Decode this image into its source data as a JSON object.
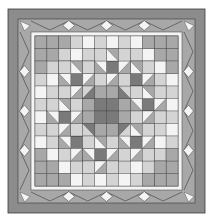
{
  "image": {
    "subject": "Quilt pattern",
    "width": 212,
    "height": 219
  },
  "colors": {
    "background": "#ffffff",
    "outer_border": "#8c8c8c",
    "dark": "#7a7a7a",
    "medium": "#a8a8a8",
    "light": "#d4d4d4",
    "white": "#f4f4f4",
    "line": "#3a3a3a"
  },
  "layout": {
    "quilt_box": [
      8,
      9,
      197,
      204
    ],
    "outer_band": 10,
    "sawtooth_band": 13,
    "white_strip": 4,
    "inner_box": [
      35,
      37,
      143,
      148
    ],
    "diamonds_per_side": 3
  },
  "blocks": {
    "center": "Sawtooth star / snowball medallion",
    "corners": "Ohio star blocks on diagonal",
    "corner_fill": "Large medium-gray L-shaped corner areas"
  }
}
